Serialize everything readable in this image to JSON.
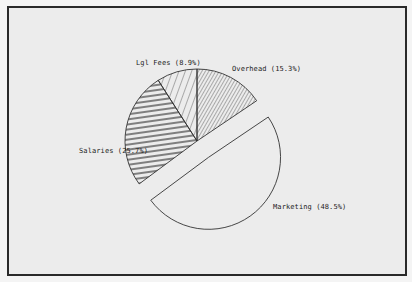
{
  "chart_data": {
    "type": "pie",
    "title": "",
    "exploded": [
      "Marketing"
    ],
    "slices": [
      {
        "label": "Overhead",
        "value": 15.3,
        "display": "Overhead (15.3%)",
        "pattern": "diag-dense"
      },
      {
        "label": "Marketing",
        "value": 48.5,
        "display": "Marketing (48.5%)",
        "pattern": "none"
      },
      {
        "label": "Salaries",
        "value": 25.7,
        "display": "Salaries (25.7%)",
        "pattern": "horizontal"
      },
      {
        "label": "Lgl Fees",
        "value": 8.9,
        "display": "Lgl Fees (8.9%)",
        "pattern": "diag-wide"
      }
    ],
    "legend": "inline labels",
    "colors": {
      "line": "#333333",
      "background": "#ececec",
      "frame": "#2a2a2a"
    }
  },
  "labels": {
    "overhead": "Overhead (15.3%)",
    "marketing": "Marketing (48.5%)",
    "salaries": "Salaries (25.7%)",
    "lgl_fees": "Lgl Fees (8.9%)"
  }
}
